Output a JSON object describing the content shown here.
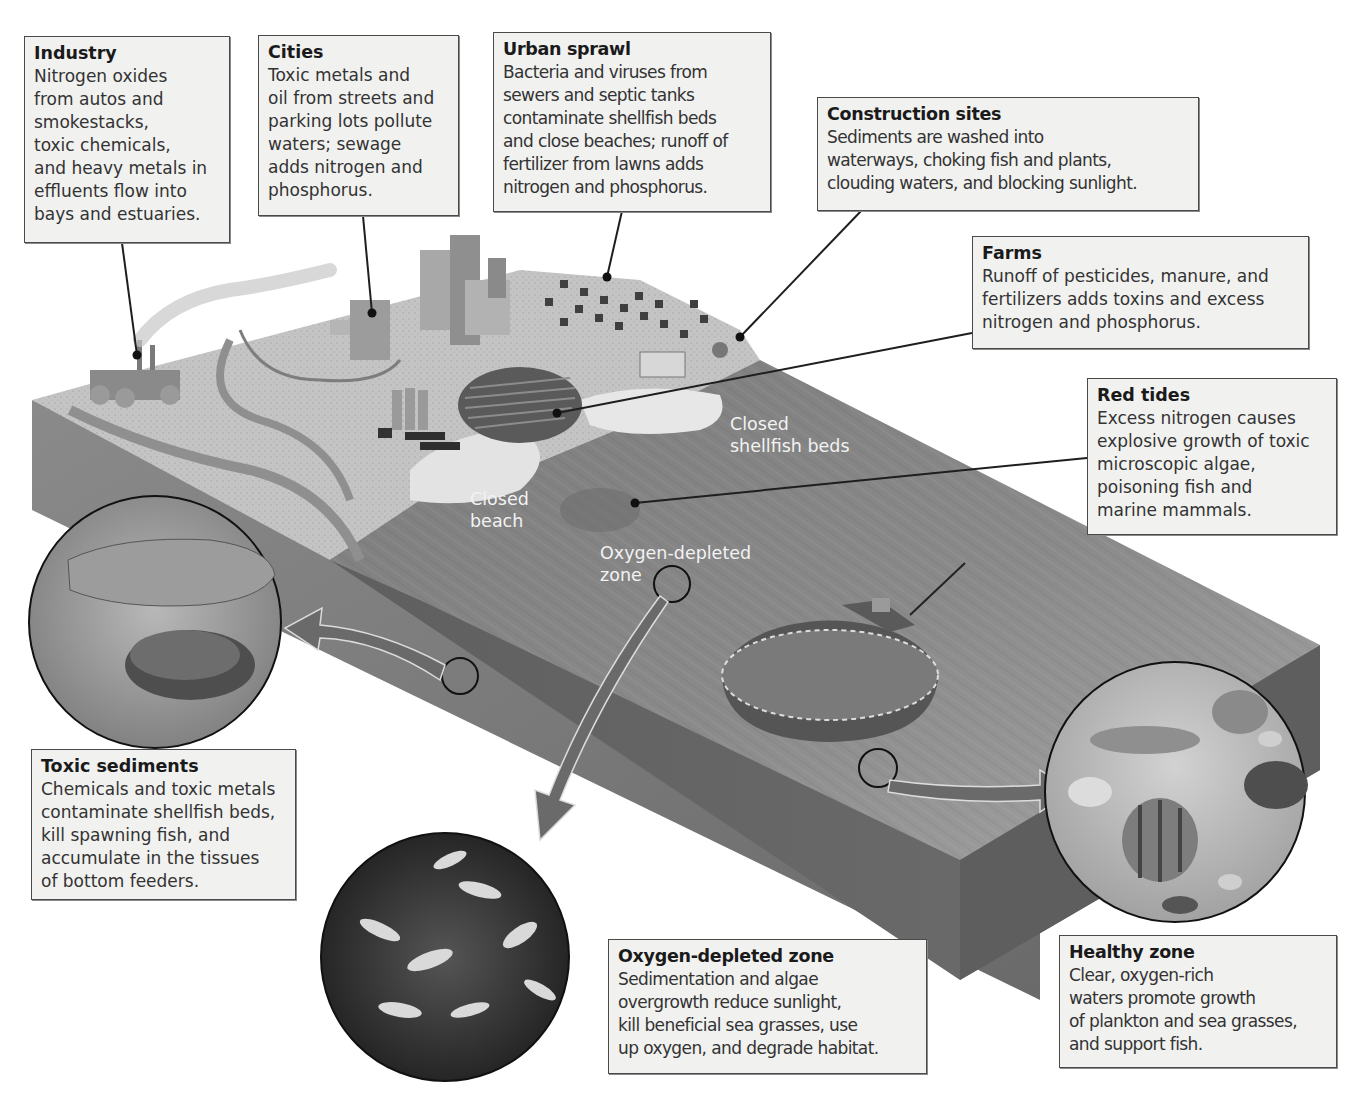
{
  "figure": {
    "colors": {
      "background": "#ffffff",
      "callout_fill": "#f1f1f0",
      "callout_border": "#4a4a4a",
      "water_surface": "#8c8c8c",
      "water_side": "#6e6e6e",
      "land": "#bdbdbd",
      "scene_label_text": "#f2f2f2"
    }
  },
  "callouts": {
    "industry": {
      "title": "Industry",
      "body": "Nitrogen oxides\nfrom autos and\nsmokestacks,\ntoxic chemicals,\nand heavy metals in\neffluents flow into\nbays and estuaries."
    },
    "cities": {
      "title": "Cities",
      "body": "Toxic metals and\noil from streets and\nparking lots pollute\nwaters; sewage\nadds nitrogen and\nphosphorus."
    },
    "urban_sprawl": {
      "title": "Urban sprawl",
      "body": "Bacteria and viruses from\nsewers and septic tanks\ncontaminate shellfish beds\nand close beaches; runoff of\nfertilizer from lawns adds\nnitrogen and phosphorus."
    },
    "construction_sites": {
      "title": "Construction sites",
      "body": "Sediments are washed into\nwaterways, choking fish and plants,\nclouding waters, and blocking sunlight."
    },
    "farms": {
      "title": "Farms",
      "body": "Runoff of pesticides, manure, and\nfertilizers adds toxins and excess\nnitrogen and phosphorus."
    },
    "red_tides": {
      "title": "Red tides",
      "body": "Excess nitrogen causes\nexplosive growth of toxic\nmicroscopic algae,\npoisoning fish and\nmarine mammals."
    },
    "toxic_sediments": {
      "title": "Toxic sediments",
      "body": "Chemicals and toxic metals\ncontaminate shellfish beds,\nkill spawning fish, and\naccumulate in the tissues\nof bottom feeders."
    },
    "oxygen_depleted_zone": {
      "title": "Oxygen-depleted zone",
      "body": "Sedimentation and algae\novergrowth reduce sunlight,\nkill beneficial sea grasses, use\nup oxygen, and degrade habitat."
    },
    "healthy_zone": {
      "title": "Healthy zone",
      "body": "Clear, oxygen-rich\nwaters promote growth\nof plankton and sea grasses,\nand support fish."
    }
  },
  "scene_labels": {
    "closed_shellfish_beds": "Closed\nshellfish beds",
    "closed_beach": "Closed\nbeach",
    "oxygen_depleted_zone": "Oxygen-depleted\nzone"
  },
  "insets": [
    {
      "name": "toxic-sediments-inset",
      "depicts": "fish and crab on contaminated seabed"
    },
    {
      "name": "oxygen-depleted-inset",
      "depicts": "dead fish"
    },
    {
      "name": "healthy-zone-inset",
      "depicts": "turtle and reef fish"
    }
  ]
}
